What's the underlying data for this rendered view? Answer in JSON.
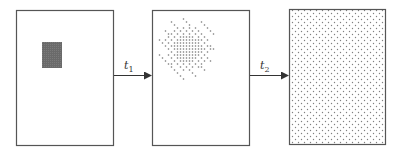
{
  "diagram": {
    "type": "diffusion-process",
    "stages": [
      {
        "id": "initial",
        "description": "concentrated block"
      },
      {
        "id": "intermediate",
        "description": "partially diffused cloud"
      },
      {
        "id": "final",
        "description": "uniformly distributed"
      }
    ],
    "transitions": [
      {
        "from": "initial",
        "to": "intermediate",
        "label": "t",
        "subscript": "1"
      },
      {
        "from": "intermediate",
        "to": "final",
        "label": "t",
        "subscript": "2"
      }
    ],
    "colors": {
      "border": "#555555",
      "block": "#6e6e6e",
      "dot": "#777777",
      "arrow": "#333333"
    }
  }
}
